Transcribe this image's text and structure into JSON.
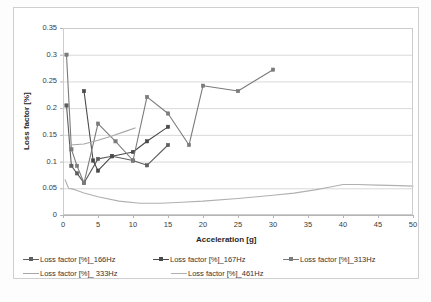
{
  "chart_data": {
    "type": "line",
    "title": "",
    "xlabel": "Acceleration [g]",
    "ylabel": "Loss factor [%]",
    "xlim": [
      0,
      50
    ],
    "ylim": [
      0,
      0.35
    ],
    "xticks": [
      "0",
      "5",
      "10",
      "15",
      "20",
      "25",
      "30",
      "35",
      "40",
      "45",
      "50"
    ],
    "yticks": [
      "0",
      "0.05",
      "0.1",
      "0.15",
      "0.2",
      "0.25",
      "0.3",
      "0.35"
    ],
    "grid": "horizontal",
    "legend_position": "bottom",
    "series": [
      {
        "name": "Loss factor [%]_166Hz",
        "color": "#5e5e5e",
        "marker": "square",
        "x": [
          0.5,
          1.2,
          2.0,
          3.0,
          5.0,
          7.0,
          10.0,
          12.0,
          15.0
        ],
        "y": [
          0.205,
          0.092,
          0.078,
          0.06,
          0.105,
          0.11,
          0.102,
          0.093,
          0.131
        ]
      },
      {
        "name": "Loss factor [%]_167Hz",
        "color": "#4a4a4a",
        "marker": "square",
        "x": [
          3.0,
          4.3,
          5.0,
          7.0,
          10.0,
          12.0,
          15.0
        ],
        "y": [
          0.232,
          0.102,
          0.083,
          0.11,
          0.118,
          0.138,
          0.165
        ]
      },
      {
        "name": "Loss factor [%]_313Hz",
        "color": "#7b7b7b",
        "marker": "square",
        "x": [
          0.5,
          1.2,
          2.0,
          3.0,
          5.0,
          7.5,
          10.0,
          12.0,
          15.0,
          18.0,
          20.0,
          25.0,
          30.0
        ],
        "y": [
          0.3,
          0.123,
          0.092,
          0.06,
          0.171,
          0.138,
          0.102,
          0.221,
          0.19,
          0.131,
          0.242,
          0.232,
          0.272
        ]
      },
      {
        "name": "Loss factor [%]_ 333Hz",
        "color": "#a6a6a6",
        "marker": "none",
        "x": [
          1.0,
          3.0,
          5.0,
          7.0,
          9.0,
          10.3
        ],
        "y": [
          0.131,
          0.133,
          0.14,
          0.148,
          0.157,
          0.163
        ]
      },
      {
        "name": "Loss factor [%]_461Hz",
        "color": "#b0b0b0",
        "marker": "none",
        "x": [
          0.3,
          0.8,
          1.5,
          3.0,
          5.0,
          8.0,
          11.0,
          14.0,
          17.0,
          20.0,
          25.0,
          30.0,
          33.0,
          36.0,
          38.0,
          40.0,
          42.0,
          45.0,
          48.0,
          50.0
        ],
        "y": [
          0.066,
          0.05,
          0.048,
          0.041,
          0.034,
          0.026,
          0.022,
          0.022,
          0.024,
          0.026,
          0.031,
          0.037,
          0.041,
          0.047,
          0.052,
          0.057,
          0.057,
          0.056,
          0.055,
          0.054
        ]
      }
    ]
  },
  "legend": {
    "row1": [
      {
        "label": "Loss factor [%]_166Hz",
        "color": "#5e5e5e",
        "marker": "square"
      },
      {
        "label": "Loss factor [%]_167Hz",
        "color": "#4a4a4a",
        "marker": "square"
      },
      {
        "label": "Loss factor [%]_313Hz",
        "color": "#7b7b7b",
        "marker": "square"
      }
    ],
    "row2": [
      {
        "label": "Loss factor [%]_ 333Hz",
        "color": "#a6a6a6",
        "marker": "none"
      },
      {
        "label": "Loss factor [%]_461Hz",
        "color": "#b0b0b0",
        "marker": "none"
      }
    ]
  }
}
